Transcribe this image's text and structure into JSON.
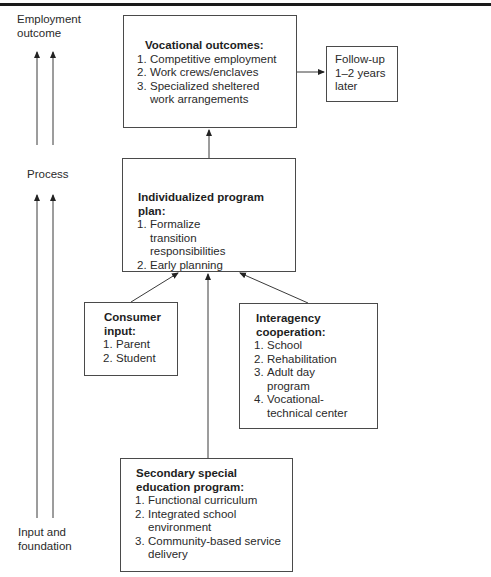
{
  "diagram": {
    "side_labels": {
      "top": [
        "Employment",
        "outcome"
      ],
      "middle": "Process",
      "bottom": [
        "Input and",
        "foundation"
      ]
    },
    "boxes": {
      "vocational": {
        "title": "Vocational outcomes:",
        "items": [
          {
            "num": "1.",
            "text": "Competitive employment"
          },
          {
            "num": "2.",
            "text": "Work crews/enclaves"
          },
          {
            "num": "3.",
            "text": "Specialized sheltered work arrangements"
          }
        ]
      },
      "followup": {
        "lines": [
          "Follow-up",
          "1–2 years",
          "later"
        ]
      },
      "ipp": {
        "title": "Individualized program plan:",
        "items": [
          {
            "num": "1.",
            "text": "Formalize transition responsibilities"
          },
          {
            "num": "2.",
            "text": "Early planning"
          }
        ]
      },
      "consumer": {
        "title": "Consumer input:",
        "items": [
          {
            "num": "1.",
            "text": "Parent"
          },
          {
            "num": "2.",
            "text": "Student"
          }
        ]
      },
      "interagency": {
        "title": "Interagency cooperation:",
        "items": [
          {
            "num": "1.",
            "text": "School"
          },
          {
            "num": "2.",
            "text": "Rehabilitation"
          },
          {
            "num": "3.",
            "text": "Adult day program"
          },
          {
            "num": "4.",
            "text": "Vocational-technical center"
          }
        ]
      },
      "secondary": {
        "title": "Secondary special education program:",
        "items": [
          {
            "num": "1.",
            "text": "Functional curriculum"
          },
          {
            "num": "2.",
            "text": "Integrated school environment"
          },
          {
            "num": "3.",
            "text": "Community-based service delivery"
          }
        ]
      }
    },
    "connections": [
      {
        "from": "vocational",
        "to": "followup"
      },
      {
        "from": "ipp",
        "to": "vocational"
      },
      {
        "from": "consumer",
        "to": "ipp"
      },
      {
        "from": "interagency",
        "to": "ipp"
      },
      {
        "from": "secondary",
        "to": "ipp"
      }
    ],
    "colors": {
      "line": "#3a3a3a",
      "text": "#2a2a2a",
      "rule": "#1a1a1a"
    }
  }
}
